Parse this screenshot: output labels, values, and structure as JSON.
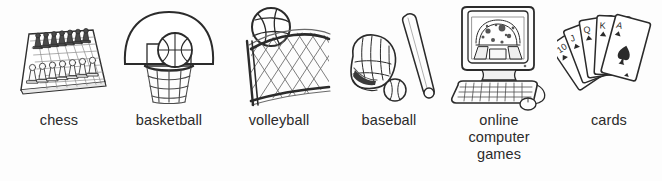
{
  "page": {
    "background_color": "#fdfdfd",
    "ink_color": "#2b2b2b"
  },
  "items": [
    {
      "id": "chess",
      "label": "chess",
      "icon": "chessboard-with-pieces-icon",
      "description": "Chess board in perspective with dark pieces at the back row and light pieces at the front"
    },
    {
      "id": "basketball",
      "label": "basketball",
      "icon": "basketball-hoop-icon",
      "description": "Fan-shaped backboard with inner rectangle, rim, hanging net and a ball"
    },
    {
      "id": "volleyball",
      "label": "volleyball",
      "icon": "volleyball-net-icon",
      "description": "Volleyball above a diamond mesh net with a pole on the left"
    },
    {
      "id": "baseball",
      "label": "baseball",
      "icon": "baseball-bat-glove-icon",
      "description": "Catcher's mitt, diagonal bat and a ball"
    },
    {
      "id": "online-computer-games",
      "label": "online\ncomputer\ngames",
      "icon": "desktop-computer-icon",
      "description": "CRT monitor showing a game scene, keyboard and mouse with cable"
    },
    {
      "id": "cards",
      "label": "cards",
      "icon": "playing-cards-fan-icon",
      "description": "Fan of five playing cards with spade and heart pips"
    }
  ]
}
